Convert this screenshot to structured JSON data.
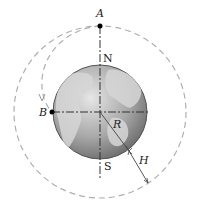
{
  "diagram": {
    "labels": {
      "A": "A",
      "B": "B",
      "N": "N",
      "S": "S",
      "R": "R",
      "H": "H"
    },
    "colors": {
      "orbit": "#b0b0b0",
      "earth_fill": "#9a9a9a",
      "earth_land": "#c8c8c8",
      "lines": "#333333",
      "points": "#000000"
    }
  }
}
